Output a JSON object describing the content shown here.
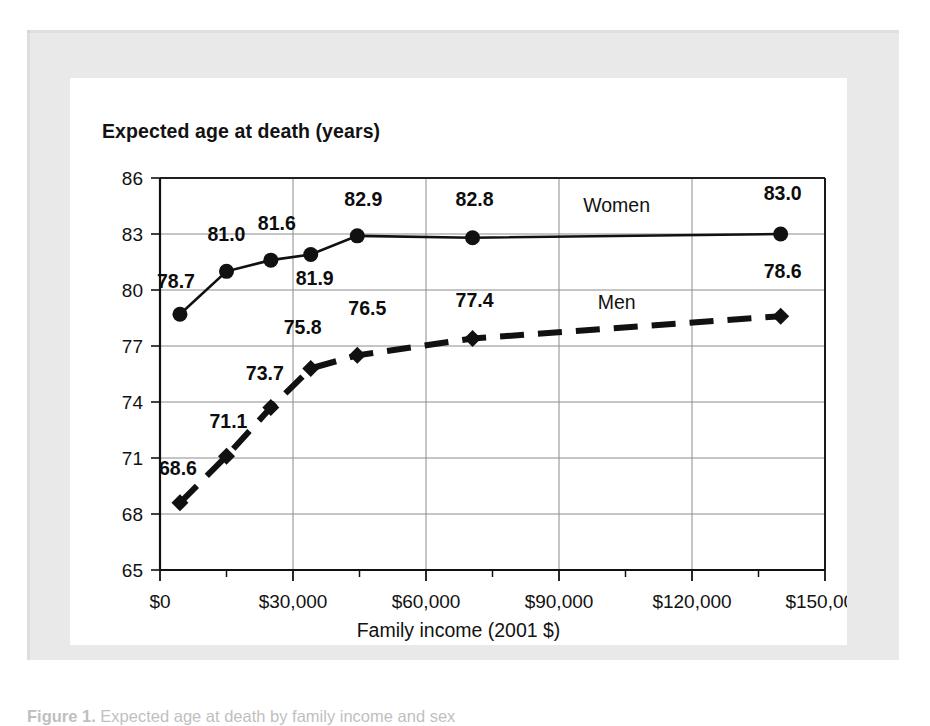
{
  "figure": {
    "caption_label": "Figure 1.",
    "caption_text": "Expected age at death by family income and sex"
  },
  "chart_data": {
    "type": "line",
    "title": "",
    "xlabel": "Family income (2001 $)",
    "ylabel": "Expected age at death (years)",
    "xlim": [
      0,
      150000
    ],
    "ylim": [
      65,
      86
    ],
    "grid": true,
    "legend_position": "inline-right",
    "x_ticks_major": [
      0,
      30000,
      60000,
      90000,
      120000,
      150000
    ],
    "x_tick_labels": [
      "$0",
      "$30,000",
      "$60,000",
      "$90,000",
      "$120,000",
      "$150,000"
    ],
    "x_ticks_minor": [
      15000,
      45000,
      75000,
      105000,
      135000
    ],
    "y_ticks": [
      65,
      68,
      71,
      74,
      77,
      80,
      83,
      86
    ],
    "y_tick_labels": [
      "65",
      "68",
      "71",
      "74",
      "77",
      "80",
      "83",
      "86"
    ],
    "series": [
      {
        "name": "Women",
        "marker": "circle",
        "line_style": "solid",
        "label_position": "above",
        "x": [
          4500,
          15000,
          25000,
          34000,
          44500,
          70500,
          140000
        ],
        "values": [
          78.7,
          81.0,
          81.6,
          81.9,
          82.9,
          82.8,
          83.0
        ],
        "point_labels": [
          "78.7",
          "81.0",
          "81.6",
          "81.9",
          "82.9",
          "82.8",
          "83.0"
        ]
      },
      {
        "name": "Men",
        "marker": "diamond",
        "line_style": "dashed",
        "label_position": "above",
        "x": [
          4500,
          15000,
          25000,
          34000,
          44500,
          70500,
          140000
        ],
        "values": [
          68.6,
          71.1,
          73.7,
          75.8,
          76.5,
          77.4,
          78.6
        ],
        "point_labels": [
          "68.6",
          "71.1",
          "73.7",
          "75.8",
          "76.5",
          "77.4",
          "78.6"
        ]
      }
    ],
    "series_annotations": [
      {
        "text": "Women",
        "x": 103000,
        "y": 84.2
      },
      {
        "text": "Men",
        "x": 103000,
        "y": 79.0
      }
    ],
    "colors": {
      "line": "#111111",
      "marker": "#111111",
      "grid": "#8c8c8c",
      "axis": "#111111",
      "plot_background": "#ffffff",
      "card_background": "#ffffff",
      "mat_background": "#e9e9e9"
    }
  }
}
